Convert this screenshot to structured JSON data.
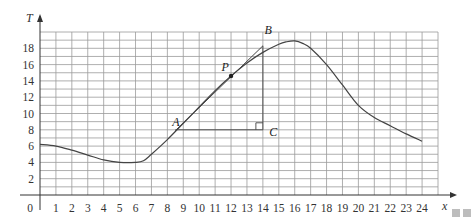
{
  "chart_data": {
    "type": "line",
    "title": "",
    "xlabel": "x",
    "ylabel": "T",
    "xlim": [
      0,
      25
    ],
    "ylim": [
      0,
      20
    ],
    "grid": true,
    "x_ticks": [
      "0",
      "1",
      "2",
      "3",
      "4",
      "5",
      "6",
      "7",
      "8",
      "9",
      "10",
      "11",
      "12",
      "13",
      "14",
      "15",
      "16",
      "17",
      "18",
      "19",
      "20",
      "21",
      "22",
      "23",
      "24"
    ],
    "y_ticks": [
      "2",
      "4",
      "6",
      "8",
      "10",
      "12",
      "14",
      "16",
      "18"
    ],
    "series": [
      {
        "name": "T(x)",
        "x": [
          0,
          1,
          2,
          3,
          4,
          5,
          6,
          6.5,
          7,
          8,
          9,
          10,
          11,
          12,
          13,
          14,
          15,
          15.5,
          16,
          16.5,
          17,
          18,
          19,
          20,
          21,
          22,
          23,
          24
        ],
        "y": [
          6.2,
          6.0,
          5.5,
          4.9,
          4.3,
          4.0,
          4.0,
          4.2,
          5.0,
          6.8,
          8.8,
          10.8,
          12.8,
          14.6,
          16.2,
          17.5,
          18.5,
          18.8,
          18.9,
          18.6,
          18.0,
          16.0,
          13.5,
          11.0,
          9.5,
          8.5,
          7.5,
          6.6
        ]
      }
    ],
    "tangent_line": {
      "from": {
        "x": 8.5,
        "y": 7.9
      },
      "to": {
        "x": 14,
        "y": 18.3
      }
    },
    "annotations": [
      {
        "label": "A",
        "x": 8.2,
        "y": 8.3
      },
      {
        "label": "B",
        "x": 14.2,
        "y": 19.5
      },
      {
        "label": "C",
        "x": 14.5,
        "y": 7.6
      },
      {
        "label": "P",
        "x": 11.6,
        "y": 15.3
      }
    ],
    "right_angle_marker": {
      "x": 14,
      "y": 8
    }
  },
  "labels": {
    "y_axis": "T",
    "x_axis": "x",
    "origin": "0",
    "point_a": "A",
    "point_b": "B",
    "point_c": "C",
    "point_p": "P"
  }
}
